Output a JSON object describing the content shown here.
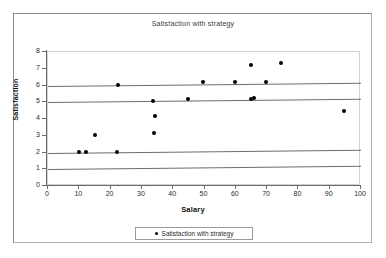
{
  "chart_data": {
    "type": "scatter",
    "title": "Satisfaction with strategy",
    "xlabel": "Salary",
    "ylabel": "Satisfaction",
    "xlim": [
      0,
      100
    ],
    "ylim": [
      0,
      8
    ],
    "xticks": [
      0,
      10,
      20,
      30,
      40,
      50,
      60,
      70,
      80,
      90,
      100
    ],
    "yticks": [
      0,
      1,
      2,
      3,
      4,
      5,
      6,
      7,
      8
    ],
    "grid": "horizontal gridlines at y = 1, 2, 5, 6 (slightly slanted scan artifact)",
    "gridlines": [
      1,
      2,
      5,
      6
    ],
    "legend_position": "bottom-center",
    "marker": "filled-diamond",
    "marker_color": "#000000",
    "series": [
      {
        "name": "Satisfaction with strategy",
        "points": [
          [
            10.0,
            2.0
          ],
          [
            12.0,
            2.0
          ],
          [
            15.0,
            3.0
          ],
          [
            22.2,
            2.0
          ],
          [
            22.5,
            6.0
          ],
          [
            33.5,
            5.0
          ],
          [
            34.2,
            4.1
          ],
          [
            34.0,
            3.1
          ],
          [
            44.8,
            5.1
          ],
          [
            49.5,
            6.1
          ],
          [
            59.7,
            6.1
          ],
          [
            64.8,
            7.1
          ],
          [
            64.8,
            5.1
          ],
          [
            65.8,
            5.1
          ],
          [
            69.5,
            6.1
          ],
          [
            74.5,
            7.2
          ],
          [
            94.5,
            4.3
          ]
        ]
      }
    ]
  },
  "legend": {
    "label": "Satisfaction with strategy"
  }
}
